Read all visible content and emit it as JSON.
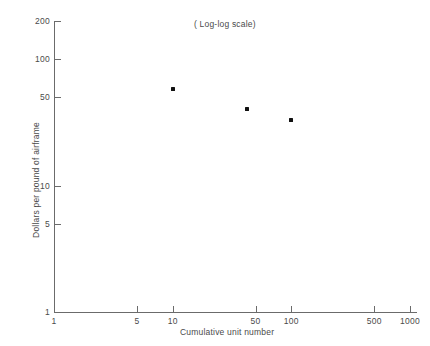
{
  "chart_data": {
    "type": "scatter",
    "title": "",
    "annotation": "( Log-log scale)",
    "xlabel": "Cumulative unit number",
    "ylabel": "Dollars per pound of airframe",
    "xscale": "log",
    "yscale": "log",
    "xlim": [
      1,
      1000
    ],
    "ylim": [
      1,
      200
    ],
    "grid": false,
    "legend": null,
    "xticks": [
      {
        "value": 1,
        "label": "1"
      },
      {
        "value": 5,
        "label": "5"
      },
      {
        "value": 10,
        "label": "10"
      },
      {
        "value": 50,
        "label": "50"
      },
      {
        "value": 100,
        "label": "100"
      },
      {
        "value": 500,
        "label": "500"
      },
      {
        "value": 1000,
        "label": "1000"
      }
    ],
    "yticks": [
      {
        "value": 1,
        "label": "1"
      },
      {
        "value": 5,
        "label": "5"
      },
      {
        "value": 10,
        "label": "10"
      },
      {
        "value": 50,
        "label": "50"
      },
      {
        "value": 100,
        "label": "100"
      },
      {
        "value": 200,
        "label": "200"
      }
    ],
    "points": [
      {
        "x": 10,
        "y": 58
      },
      {
        "x": 42,
        "y": 40
      },
      {
        "x": 100,
        "y": 33
      }
    ],
    "marker": "square",
    "marker_color": "#111111",
    "axis_color": "#6b6b6b",
    "background_color": "#ffffff"
  }
}
